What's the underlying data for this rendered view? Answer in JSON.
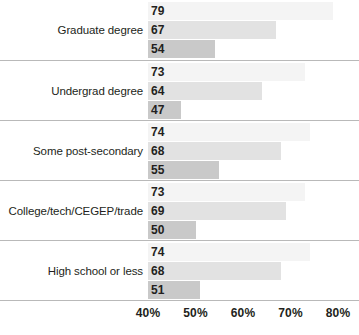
{
  "chart_data": {
    "type": "bar",
    "orientation": "horizontal",
    "title": "",
    "subtitle": "",
    "xlabel": "",
    "ylabel": "",
    "xlim": [
      40,
      80
    ],
    "xticks": [
      40,
      50,
      60,
      70,
      80
    ],
    "xtick_labels": [
      "40%",
      "50%",
      "60%",
      "70%",
      "80%"
    ],
    "grid": false,
    "legend": "none",
    "value_suffix": "",
    "categories": [
      "Graduate degree",
      "Undergrad degree",
      "Some post-secondary",
      "College/tech/CEGEP/trade",
      "High school or less"
    ],
    "series": [
      {
        "name": "series-1",
        "color": "#f4f4f4",
        "values": [
          79,
          73,
          74,
          73,
          74
        ]
      },
      {
        "name": "series-2",
        "color": "#e2e2e2",
        "values": [
          67,
          64,
          68,
          69,
          68
        ]
      },
      {
        "name": "series-3",
        "color": "#c9c9c9",
        "values": [
          54,
          47,
          55,
          50,
          51
        ]
      }
    ],
    "groups": [
      {
        "category": "Graduate degree",
        "bars": [
          {
            "value": 79,
            "label": "79",
            "shade": "s0"
          },
          {
            "value": 67,
            "label": "67",
            "shade": "s1"
          },
          {
            "value": 54,
            "label": "54",
            "shade": "s2"
          }
        ]
      },
      {
        "category": "Undergrad degree",
        "bars": [
          {
            "value": 73,
            "label": "73",
            "shade": "s0"
          },
          {
            "value": 64,
            "label": "64",
            "shade": "s1"
          },
          {
            "value": 47,
            "label": "47",
            "shade": "s2"
          }
        ]
      },
      {
        "category": "Some post-secondary",
        "bars": [
          {
            "value": 74,
            "label": "74",
            "shade": "s0"
          },
          {
            "value": 68,
            "label": "68",
            "shade": "s1"
          },
          {
            "value": 55,
            "label": "55",
            "shade": "s2"
          }
        ]
      },
      {
        "category": "College/tech/CEGEP/trade",
        "bars": [
          {
            "value": 73,
            "label": "73",
            "shade": "s0"
          },
          {
            "value": 69,
            "label": "69",
            "shade": "s1"
          },
          {
            "value": 50,
            "label": "50",
            "shade": "s2"
          }
        ]
      },
      {
        "category": "High school or less",
        "bars": [
          {
            "value": 74,
            "label": "74",
            "shade": "s0"
          },
          {
            "value": 68,
            "label": "68",
            "shade": "s1"
          },
          {
            "value": 51,
            "label": "51",
            "shade": "s2"
          }
        ]
      }
    ]
  }
}
